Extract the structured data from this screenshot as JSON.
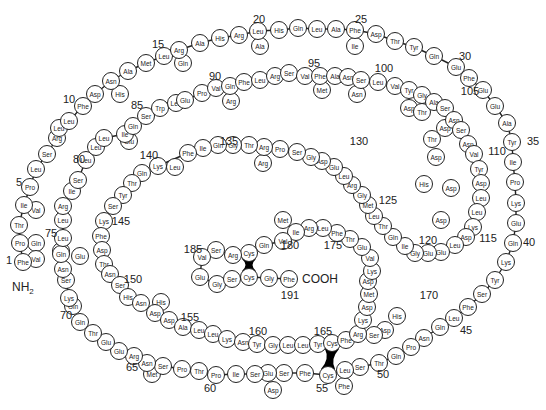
{
  "diagram": {
    "type": "protein primary structure",
    "n_terminus": "NH",
    "n_terminus_sub": "2",
    "c_terminus": "COOH",
    "position_labels": [
      {
        "n": "1",
        "x": 9,
        "y": 260
      },
      {
        "n": "5",
        "x": 19,
        "y": 182
      },
      {
        "n": "10",
        "x": 69,
        "y": 99
      },
      {
        "n": "15",
        "x": 158,
        "y": 44
      },
      {
        "n": "20",
        "x": 259,
        "y": 19
      },
      {
        "n": "25",
        "x": 361,
        "y": 19
      },
      {
        "n": "30",
        "x": 465,
        "y": 56
      },
      {
        "n": "35",
        "x": 533,
        "y": 141
      },
      {
        "n": "40",
        "x": 529,
        "y": 242
      },
      {
        "n": "45",
        "x": 466,
        "y": 330
      },
      {
        "n": "50",
        "x": 383,
        "y": 374
      },
      {
        "n": "55",
        "x": 322,
        "y": 388
      },
      {
        "n": "60",
        "x": 210,
        "y": 388
      },
      {
        "n": "65",
        "x": 132,
        "y": 367
      },
      {
        "n": "70",
        "x": 66,
        "y": 315
      },
      {
        "n": "75",
        "x": 51,
        "y": 233
      },
      {
        "n": "80",
        "x": 79,
        "y": 159
      },
      {
        "n": "85",
        "x": 137,
        "y": 105
      },
      {
        "n": "90",
        "x": 215,
        "y": 76
      },
      {
        "n": "95",
        "x": 314,
        "y": 63
      },
      {
        "n": "100",
        "x": 384,
        "y": 68
      },
      {
        "n": "105",
        "x": 470,
        "y": 91
      },
      {
        "n": "110",
        "x": 497,
        "y": 151
      },
      {
        "n": "115",
        "x": 488,
        "y": 238
      },
      {
        "n": "120",
        "x": 428,
        "y": 240
      },
      {
        "n": "125",
        "x": 388,
        "y": 200
      },
      {
        "n": "130",
        "x": 359,
        "y": 141
      },
      {
        "n": "135",
        "x": 229,
        "y": 141
      },
      {
        "n": "140",
        "x": 149,
        "y": 155
      },
      {
        "n": "145",
        "x": 121,
        "y": 221
      },
      {
        "n": "150",
        "x": 133,
        "y": 279
      },
      {
        "n": "155",
        "x": 190,
        "y": 317
      },
      {
        "n": "160",
        "x": 258,
        "y": 331
      },
      {
        "n": "165",
        "x": 323,
        "y": 331
      },
      {
        "n": "170",
        "x": 429,
        "y": 295
      },
      {
        "n": "175",
        "x": 333,
        "y": 245
      },
      {
        "n": "180",
        "x": 290,
        "y": 245
      },
      {
        "n": "185",
        "x": 193,
        "y": 249
      },
      {
        "n": "191",
        "x": 290,
        "y": 295
      }
    ],
    "residues": [
      {
        "aa": "Phe",
        "x": 23,
        "y": 262
      },
      {
        "aa": "Pro",
        "x": 20,
        "y": 243
      },
      {
        "aa": "Thr",
        "x": 19,
        "y": 225
      },
      {
        "aa": "Ile",
        "x": 24,
        "y": 205
      },
      {
        "aa": "Pro",
        "x": 30,
        "y": 187
      },
      {
        "aa": "Leu",
        "x": 36,
        "y": 169
      },
      {
        "aa": "Ser",
        "x": 47,
        "y": 154
      },
      {
        "aa": "Arg",
        "x": 57,
        "y": 138
      },
      {
        "aa": "Leu",
        "x": 59,
        "y": 128
      },
      {
        "aa": "Leu",
        "x": 69,
        "y": 121
      },
      {
        "aa": "Phe",
        "x": 83,
        "y": 106
      },
      {
        "aa": "Asp",
        "x": 95,
        "y": 94
      },
      {
        "aa": "Asn",
        "x": 111,
        "y": 81
      },
      {
        "aa": "Ala",
        "x": 128,
        "y": 71
      },
      {
        "aa": "Met",
        "x": 146,
        "y": 63
      },
      {
        "aa": "Leu",
        "x": 164,
        "y": 56
      },
      {
        "aa": "Arg",
        "x": 179,
        "y": 50
      },
      {
        "aa": "Ala",
        "x": 200,
        "y": 43
      },
      {
        "aa": "His",
        "x": 220,
        "y": 38
      },
      {
        "aa": "Arg",
        "x": 239,
        "y": 35
      },
      {
        "aa": "Leu",
        "x": 258,
        "y": 31
      },
      {
        "aa": "His",
        "x": 279,
        "y": 30
      },
      {
        "aa": "Gln",
        "x": 298,
        "y": 28
      },
      {
        "aa": "Leu",
        "x": 317,
        "y": 29
      },
      {
        "aa": "Ala",
        "x": 336,
        "y": 29
      },
      {
        "aa": "Phe",
        "x": 355,
        "y": 30
      },
      {
        "aa": "Asp",
        "x": 376,
        "y": 34
      },
      {
        "aa": "Thr",
        "x": 395,
        "y": 41
      },
      {
        "aa": "Tyr",
        "x": 414,
        "y": 47
      },
      {
        "aa": "Gln",
        "x": 434,
        "y": 56
      },
      {
        "aa": "Glu",
        "x": 456,
        "y": 67
      },
      {
        "aa": "Phe",
        "x": 469,
        "y": 78
      },
      {
        "aa": "Glu",
        "x": 483,
        "y": 90
      },
      {
        "aa": "Glu",
        "x": 495,
        "y": 106
      },
      {
        "aa": "Ala",
        "x": 507,
        "y": 123
      },
      {
        "aa": "Tyr",
        "x": 512,
        "y": 142
      },
      {
        "aa": "Ile",
        "x": 513,
        "y": 162
      },
      {
        "aa": "Pro",
        "x": 515,
        "y": 182
      },
      {
        "aa": "Lys",
        "x": 516,
        "y": 203
      },
      {
        "aa": "Glu",
        "x": 516,
        "y": 223
      },
      {
        "aa": "Gln",
        "x": 513,
        "y": 243
      },
      {
        "aa": "Lys",
        "x": 506,
        "y": 262
      },
      {
        "aa": "Tyr",
        "x": 495,
        "y": 280
      },
      {
        "aa": "Ser",
        "x": 482,
        "y": 294
      },
      {
        "aa": "Phe",
        "x": 468,
        "y": 307
      },
      {
        "aa": "Leu",
        "x": 454,
        "y": 318
      },
      {
        "aa": "Gln",
        "x": 440,
        "y": 327
      },
      {
        "aa": "Asn",
        "x": 424,
        "y": 338
      },
      {
        "aa": "Pro",
        "x": 411,
        "y": 347
      },
      {
        "aa": "Gln",
        "x": 396,
        "y": 356
      },
      {
        "aa": "Thr",
        "x": 379,
        "y": 363
      },
      {
        "aa": "Ser",
        "x": 360,
        "y": 367
      },
      {
        "aa": "Leu",
        "x": 345,
        "y": 370
      },
      {
        "aa": "Cys",
        "x": 328,
        "y": 375
      },
      {
        "aa": "Phe",
        "x": 305,
        "y": 373
      },
      {
        "aa": "Ser",
        "x": 284,
        "y": 373
      },
      {
        "aa": "Glu",
        "x": 268,
        "y": 373
      },
      {
        "aa": "Ser",
        "x": 255,
        "y": 374
      },
      {
        "aa": "Ile",
        "x": 236,
        "y": 374
      },
      {
        "aa": "Pro",
        "x": 216,
        "y": 375
      },
      {
        "aa": "Thr",
        "x": 199,
        "y": 371
      },
      {
        "aa": "Pro",
        "x": 182,
        "y": 369
      },
      {
        "aa": "Ser",
        "x": 163,
        "y": 366
      },
      {
        "aa": "Asn",
        "x": 147,
        "y": 363
      },
      {
        "aa": "Arg",
        "x": 134,
        "y": 356
      },
      {
        "aa": "Glu",
        "x": 119,
        "y": 351
      },
      {
        "aa": "Glu",
        "x": 106,
        "y": 342
      },
      {
        "aa": "Thr",
        "x": 93,
        "y": 333
      },
      {
        "aa": "Gln",
        "x": 80,
        "y": 322
      },
      {
        "aa": "Gln",
        "x": 73,
        "y": 306
      },
      {
        "aa": "Lys",
        "x": 69,
        "y": 298
      },
      {
        "aa": "Ser",
        "x": 66,
        "y": 280
      },
      {
        "aa": "Asn",
        "x": 63,
        "y": 269
      },
      {
        "aa": "Leu",
        "x": 61,
        "y": 251
      },
      {
        "aa": "Gln",
        "x": 61,
        "y": 254
      },
      {
        "aa": "Leu",
        "x": 63,
        "y": 238
      },
      {
        "aa": "Leu",
        "x": 63,
        "y": 220
      },
      {
        "aa": "Arg",
        "x": 63,
        "y": 206
      },
      {
        "aa": "Ile",
        "x": 72,
        "y": 191
      },
      {
        "aa": "Ser",
        "x": 78,
        "y": 180
      },
      {
        "aa": "Leu",
        "x": 86,
        "y": 160
      },
      {
        "aa": "Leu",
        "x": 96,
        "y": 147
      },
      {
        "aa": "Leu",
        "x": 104,
        "y": 138
      },
      {
        "aa": "Ile",
        "x": 125,
        "y": 134
      },
      {
        "aa": "Gln",
        "x": 133,
        "y": 126
      },
      {
        "aa": "Ser",
        "x": 146,
        "y": 116
      },
      {
        "aa": "Trp",
        "x": 160,
        "y": 108
      },
      {
        "aa": "Leu",
        "x": 176,
        "y": 103
      },
      {
        "aa": "Glu",
        "x": 185,
        "y": 100
      },
      {
        "aa": "Pro",
        "x": 202,
        "y": 93
      },
      {
        "aa": "Val",
        "x": 216,
        "y": 88
      },
      {
        "aa": "Gln",
        "x": 230,
        "y": 86
      },
      {
        "aa": "Phe",
        "x": 244,
        "y": 82
      },
      {
        "aa": "Leu",
        "x": 260,
        "y": 80
      },
      {
        "aa": "Arg",
        "x": 275,
        "y": 76
      },
      {
        "aa": "Ser",
        "x": 289,
        "y": 73
      },
      {
        "aa": "Val",
        "x": 305,
        "y": 76
      },
      {
        "aa": "Phe",
        "x": 320,
        "y": 76
      },
      {
        "aa": "Ala",
        "x": 335,
        "y": 76
      },
      {
        "aa": "Asn",
        "x": 348,
        "y": 77
      },
      {
        "aa": "Ser",
        "x": 361,
        "y": 80
      },
      {
        "aa": "Leu",
        "x": 378,
        "y": 82
      },
      {
        "aa": "Val",
        "x": 395,
        "y": 86
      },
      {
        "aa": "Tyr",
        "x": 409,
        "y": 90
      },
      {
        "aa": "Gly",
        "x": 422,
        "y": 95
      },
      {
        "aa": "Ala",
        "x": 434,
        "y": 102
      },
      {
        "aa": "Ser",
        "x": 445,
        "y": 108
      },
      {
        "aa": "Asn",
        "x": 454,
        "y": 120
      },
      {
        "aa": "Ser",
        "x": 461,
        "y": 130
      },
      {
        "aa": "Asp",
        "x": 468,
        "y": 144
      },
      {
        "aa": "Val",
        "x": 474,
        "y": 154
      },
      {
        "aa": "Tyr",
        "x": 479,
        "y": 169
      },
      {
        "aa": "Asp",
        "x": 481,
        "y": 183
      },
      {
        "aa": "Leu",
        "x": 481,
        "y": 198
      },
      {
        "aa": "Leu",
        "x": 477,
        "y": 212
      },
      {
        "aa": "Lys",
        "x": 473,
        "y": 227
      },
      {
        "aa": "Asp",
        "x": 466,
        "y": 237
      },
      {
        "aa": "Leu",
        "x": 455,
        "y": 245
      },
      {
        "aa": "Glu",
        "x": 441,
        "y": 252
      },
      {
        "aa": "Glu",
        "x": 428,
        "y": 253
      },
      {
        "aa": "Gly",
        "x": 415,
        "y": 253
      },
      {
        "aa": "Ile",
        "x": 405,
        "y": 246
      },
      {
        "aa": "Gln",
        "x": 393,
        "y": 237
      },
      {
        "aa": "Thr",
        "x": 383,
        "y": 226
      },
      {
        "aa": "Leu",
        "x": 374,
        "y": 216
      },
      {
        "aa": "Met",
        "x": 368,
        "y": 205
      },
      {
        "aa": "Gly",
        "x": 362,
        "y": 195
      },
      {
        "aa": "Arg",
        "x": 352,
        "y": 185
      },
      {
        "aa": "Leu",
        "x": 344,
        "y": 176
      },
      {
        "aa": "Glu",
        "x": 334,
        "y": 167
      },
      {
        "aa": "Asp",
        "x": 322,
        "y": 161
      },
      {
        "aa": "Gly",
        "x": 311,
        "y": 157
      },
      {
        "aa": "Ser",
        "x": 297,
        "y": 152
      },
      {
        "aa": "Pro",
        "x": 280,
        "y": 149
      },
      {
        "aa": "Arg",
        "x": 264,
        "y": 147
      },
      {
        "aa": "Thr",
        "x": 249,
        "y": 145
      },
      {
        "aa": "Gly",
        "x": 233,
        "y": 145
      },
      {
        "aa": "Gln",
        "x": 218,
        "y": 145
      },
      {
        "aa": "Ile",
        "x": 203,
        "y": 148
      },
      {
        "aa": "Phe",
        "x": 188,
        "y": 153
      },
      {
        "aa": "Lys",
        "x": 158,
        "y": 166
      },
      {
        "aa": "Gln",
        "x": 142,
        "y": 173
      },
      {
        "aa": "Thr",
        "x": 132,
        "y": 183
      },
      {
        "aa": "Tyr",
        "x": 123,
        "y": 195
      },
      {
        "aa": "Ser",
        "x": 113,
        "y": 206
      },
      {
        "aa": "Lys",
        "x": 104,
        "y": 221
      },
      {
        "aa": "Phe",
        "x": 101,
        "y": 236
      },
      {
        "aa": "Asp",
        "x": 102,
        "y": 250
      },
      {
        "aa": "Thr",
        "x": 104,
        "y": 264
      },
      {
        "aa": "Asn",
        "x": 110,
        "y": 274
      },
      {
        "aa": "Ser",
        "x": 120,
        "y": 285
      },
      {
        "aa": "His",
        "x": 128,
        "y": 297
      },
      {
        "aa": "Asn",
        "x": 141,
        "y": 303
      },
      {
        "aa": "Asp",
        "x": 155,
        "y": 313
      },
      {
        "aa": "Asp",
        "x": 169,
        "y": 320
      },
      {
        "aa": "Ala",
        "x": 183,
        "y": 327
      },
      {
        "aa": "Leu",
        "x": 199,
        "y": 330
      },
      {
        "aa": "Leu",
        "x": 213,
        "y": 334
      },
      {
        "aa": "Lys",
        "x": 227,
        "y": 339
      },
      {
        "aa": "Asn",
        "x": 243,
        "y": 342
      },
      {
        "aa": "Tyr",
        "x": 257,
        "y": 344
      },
      {
        "aa": "Gly",
        "x": 273,
        "y": 345
      },
      {
        "aa": "Leu",
        "x": 288,
        "y": 345
      },
      {
        "aa": "Leu",
        "x": 303,
        "y": 345
      },
      {
        "aa": "Tyr",
        "x": 318,
        "y": 344
      },
      {
        "aa": "Cys",
        "x": 332,
        "y": 343
      },
      {
        "aa": "Phe",
        "x": 346,
        "y": 340
      },
      {
        "aa": "Arg",
        "x": 358,
        "y": 334
      },
      {
        "aa": "Lys",
        "x": 363,
        "y": 320
      },
      {
        "aa": "Asp",
        "x": 367,
        "y": 307
      },
      {
        "aa": "Met",
        "x": 369,
        "y": 294
      },
      {
        "aa": "Asp",
        "x": 368,
        "y": 281
      },
      {
        "aa": "Lys",
        "x": 372,
        "y": 271
      },
      {
        "aa": "Val",
        "x": 370,
        "y": 258
      },
      {
        "aa": "Glu",
        "x": 362,
        "y": 247
      },
      {
        "aa": "Thr",
        "x": 350,
        "y": 239
      },
      {
        "aa": "Phe",
        "x": 337,
        "y": 233
      },
      {
        "aa": "Leu",
        "x": 323,
        "y": 228
      },
      {
        "aa": "Arg",
        "x": 309,
        "y": 228
      },
      {
        "aa": "Ile",
        "x": 296,
        "y": 232
      },
      {
        "aa": "Val",
        "x": 283,
        "y": 241
      },
      {
        "aa": "Gln",
        "x": 264,
        "y": 245
      },
      {
        "aa": "Cys",
        "x": 249,
        "y": 253
      },
      {
        "aa": "Arg",
        "x": 233,
        "y": 255
      },
      {
        "aa": "Ser",
        "x": 216,
        "y": 250
      },
      {
        "aa": "Val",
        "x": 202,
        "y": 257
      },
      {
        "aa": "Glu",
        "x": 200,
        "y": 277
      },
      {
        "aa": "Gly",
        "x": 217,
        "y": 284
      },
      {
        "aa": "Ser",
        "x": 232,
        "y": 279
      },
      {
        "aa": "Cys",
        "x": 249,
        "y": 277
      },
      {
        "aa": "Gly",
        "x": 269,
        "y": 278
      },
      {
        "aa": "Phe",
        "x": 289,
        "y": 279
      }
    ],
    "branch_residues": [
      {
        "aa": "Val",
        "x": 36,
        "y": 210
      },
      {
        "aa": "Gln",
        "x": 36,
        "y": 243
      },
      {
        "aa": "Val",
        "x": 36,
        "y": 259
      },
      {
        "aa": "His",
        "x": 120,
        "y": 94
      },
      {
        "aa": "Gln",
        "x": 183,
        "y": 63
      },
      {
        "aa": "Ala",
        "x": 260,
        "y": 46
      },
      {
        "aa": "Ile",
        "x": 355,
        "y": 46
      },
      {
        "aa": "Asp",
        "x": 441,
        "y": 220
      },
      {
        "aa": "Thr",
        "x": 432,
        "y": 139
      },
      {
        "aa": "Asp",
        "x": 436,
        "y": 157
      },
      {
        "aa": "Asp",
        "x": 451,
        "y": 188
      },
      {
        "aa": "His",
        "x": 424,
        "y": 184
      },
      {
        "aa": "Asp",
        "x": 385,
        "y": 330
      },
      {
        "aa": "His",
        "x": 397,
        "y": 316
      },
      {
        "aa": "Ser",
        "x": 374,
        "y": 335
      },
      {
        "aa": "Phe",
        "x": 344,
        "y": 386
      },
      {
        "aa": "Asp",
        "x": 273,
        "y": 390
      },
      {
        "aa": "Met",
        "x": 152,
        "y": 374
      },
      {
        "aa": "Glu",
        "x": 80,
        "y": 256
      },
      {
        "aa": "Leu",
        "x": 175,
        "y": 167
      },
      {
        "aa": "His",
        "x": 161,
        "y": 302
      },
      {
        "aa": "Arg",
        "x": 231,
        "y": 101
      },
      {
        "aa": "Met",
        "x": 322,
        "y": 90
      },
      {
        "aa": "Asn",
        "x": 357,
        "y": 94
      },
      {
        "aa": "Asp",
        "x": 409,
        "y": 108
      },
      {
        "aa": "Thr",
        "x": 422,
        "y": 112
      },
      {
        "aa": "Asp",
        "x": 445,
        "y": 128
      },
      {
        "aa": "Arg",
        "x": 263,
        "y": 163
      },
      {
        "aa": "Met",
        "x": 283,
        "y": 220
      },
      {
        "aa": "Glu",
        "x": 129,
        "y": 141
      }
    ],
    "disulfide_bonds": [
      {
        "from": {
          "x": 332,
          "y": 343
        },
        "to": {
          "x": 328,
          "y": 375
        }
      },
      {
        "from": {
          "x": 249,
          "y": 253
        },
        "to": {
          "x": 249,
          "y": 277
        }
      }
    ]
  }
}
